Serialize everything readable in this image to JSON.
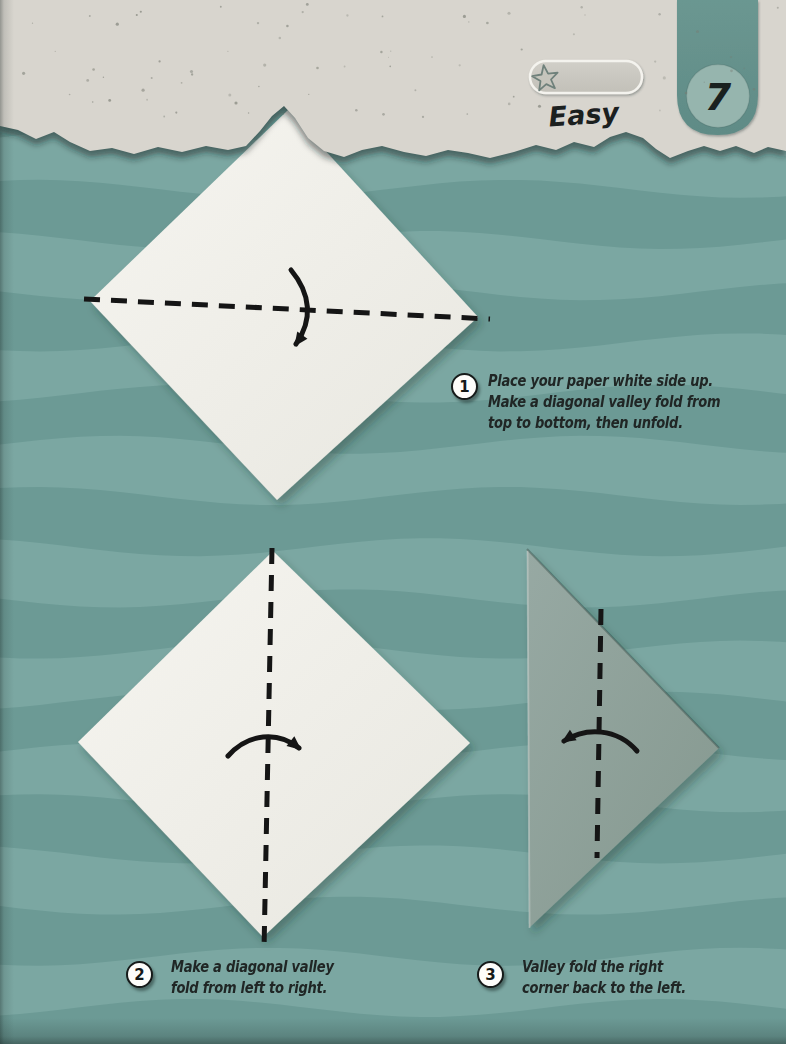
{
  "page": {
    "number": "7",
    "difficulty_label": "Easy",
    "difficulty_stars": 1
  },
  "colors": {
    "background_light": "#7BA7A2",
    "background_dark": "#6C9A95",
    "header_paper": "#D8D5CE",
    "paper_white": "#F3F2EC",
    "folded_paper": "#93A59F",
    "tab_teal": "#67938E",
    "tab_circle": "#96B5AE",
    "ink": "#161B1A",
    "text": "#202625"
  },
  "steps": [
    {
      "number": "1",
      "lines": [
        "Place your paper white side up.",
        "Make a diagonal valley fold from",
        "top to bottom, then unfold."
      ]
    },
    {
      "number": "2",
      "lines": [
        "Make a diagonal valley",
        "fold from left to right."
      ]
    },
    {
      "number": "3",
      "lines": [
        "Valley fold the right",
        "corner back to the left."
      ]
    }
  ]
}
